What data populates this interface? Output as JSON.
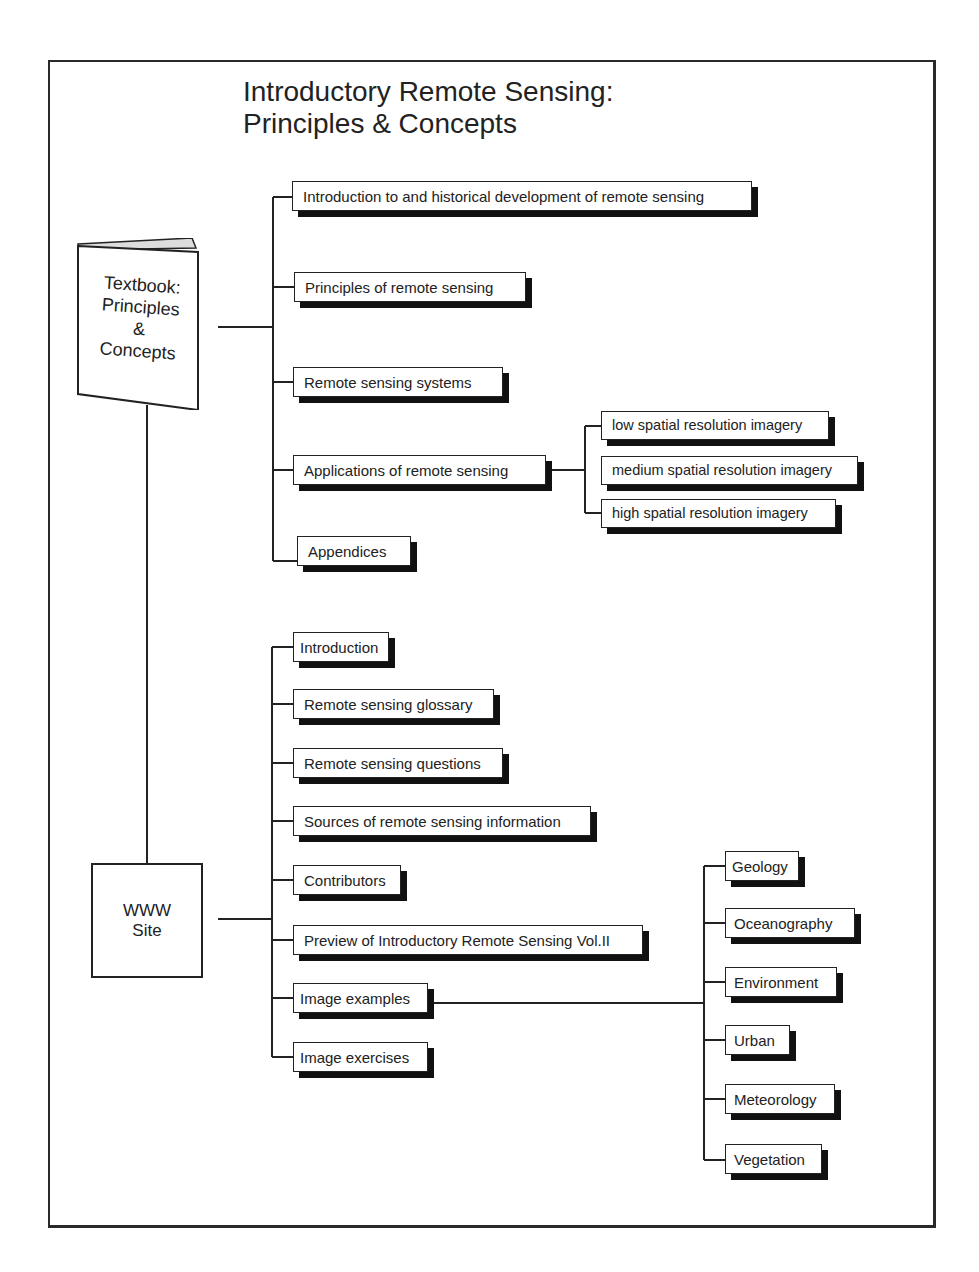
{
  "title": {
    "line1": "Introductory Remote Sensing:",
    "line2": "Principles & Concepts"
  },
  "textbook": {
    "label_lines": [
      "Textbook:",
      "Principles",
      "&",
      "Concepts"
    ],
    "icon": "book-icon",
    "children": [
      {
        "label": "Introduction to and historical development of remote sensing"
      },
      {
        "label": "Principles of remote sensing"
      },
      {
        "label": "Remote sensing systems"
      },
      {
        "label": "Applications of remote sensing",
        "children": [
          {
            "label": "low spatial resolution imagery"
          },
          {
            "label": "medium spatial resolution imagery"
          },
          {
            "label": "high spatial resolution imagery"
          }
        ]
      },
      {
        "label": "Appendices"
      }
    ]
  },
  "www_site": {
    "label_lines": [
      "WWW",
      "Site"
    ],
    "children": [
      {
        "label": "Introduction"
      },
      {
        "label": "Remote sensing glossary"
      },
      {
        "label": "Remote sensing questions"
      },
      {
        "label": "Sources of remote sensing information"
      },
      {
        "label": "Contributors"
      },
      {
        "label": "Preview of Introductory Remote Sensing Vol.II"
      },
      {
        "label": "Image examples",
        "children": [
          {
            "label": "Geology"
          },
          {
            "label": "Oceanography"
          },
          {
            "label": "Environment"
          },
          {
            "label": "Urban"
          },
          {
            "label": "Meteorology"
          },
          {
            "label": "Vegetation"
          }
        ]
      },
      {
        "label": "Image exercises"
      }
    ]
  },
  "colors": {
    "line": "#222222",
    "shadow": "#111111",
    "background": "#ffffff"
  }
}
